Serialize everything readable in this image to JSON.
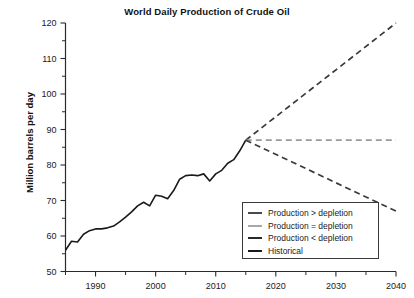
{
  "chart_data": {
    "type": "line",
    "title": "World Daily Production of Crude Oil",
    "xlabel": "",
    "ylabel": "Million barrels per day",
    "xlim": [
      1985,
      2040
    ],
    "ylim": [
      50,
      120
    ],
    "xticks": [
      1990,
      2000,
      2010,
      2020,
      2030,
      2040
    ],
    "xticks_minor": [
      1985,
      1995,
      2005,
      2015,
      2025,
      2035
    ],
    "yticks": [
      50,
      60,
      70,
      80,
      90,
      100,
      110,
      120
    ],
    "yticks_minor": [
      55,
      65,
      75,
      85,
      95,
      105,
      115
    ],
    "grid": false,
    "legend_position": "lower right",
    "series": [
      {
        "name": "Historical",
        "style": "solid",
        "color": "#1a1a1a",
        "x": [
          1985,
          1986,
          1987,
          1988,
          1989,
          1990,
          1991,
          1992,
          1993,
          1994,
          1995,
          1996,
          1997,
          1998,
          1999,
          2000,
          2001,
          2002,
          2003,
          2004,
          2005,
          2006,
          2007,
          2008,
          2009,
          2010,
          2011,
          2012,
          2013,
          2014,
          2015
        ],
        "values": [
          56.0,
          58.5,
          58.3,
          60.5,
          61.5,
          62.0,
          62.0,
          62.3,
          62.8,
          64.0,
          65.3,
          66.8,
          68.5,
          69.5,
          68.5,
          71.5,
          71.2,
          70.5,
          72.8,
          76.0,
          77.0,
          77.2,
          77.0,
          77.5,
          75.5,
          77.5,
          78.5,
          80.5,
          81.5,
          84.0,
          87.0
        ]
      },
      {
        "name": "Production > depletion",
        "style": "dashed",
        "color": "#3a3a3a",
        "x": [
          2015,
          2040
        ],
        "values": [
          87.0,
          120.0
        ]
      },
      {
        "name": "Production = depletion",
        "style": "dashed",
        "color": "#9a9a9a",
        "x": [
          2015,
          2040
        ],
        "values": [
          87.0,
          87.0
        ]
      },
      {
        "name": "Production < depletion",
        "style": "dashed",
        "color": "#3a3a3a",
        "x": [
          2015,
          2040
        ],
        "values": [
          87.0,
          67.0
        ]
      }
    ]
  },
  "title": "World Daily Production of Crude Oil",
  "axes": {
    "y_label": "Million barrels per day",
    "y_tick_labels": [
      "120",
      "110",
      "100",
      "90",
      "80",
      "70",
      "60",
      "50"
    ],
    "x_tick_labels": [
      "1990",
      "2000",
      "2010",
      "2020",
      "2030",
      "2040"
    ]
  },
  "legend": {
    "items": [
      {
        "label": "Production > depletion",
        "color": "#4a4a4a"
      },
      {
        "label": "Production = depletion",
        "color": "#a8a8a8"
      },
      {
        "label": "Production < depletion",
        "color": "#2a2a2a"
      },
      {
        "label": "Historical",
        "color": "#1a1a1a"
      }
    ]
  }
}
